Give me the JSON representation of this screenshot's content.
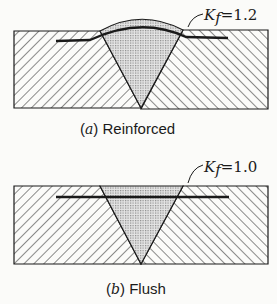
{
  "figures": [
    {
      "id": "a",
      "caption_letter": "a",
      "caption_text": "Reinforced",
      "label_k": "K",
      "label_sub": "f",
      "label_value": "=1.2"
    },
    {
      "id": "b",
      "caption_letter": "b",
      "caption_text": "Flush",
      "label_k": "K",
      "label_sub": "f",
      "label_value": "=1.0"
    }
  ],
  "colors": {
    "ink": "#1a1a1a",
    "background": "#fbfbf9",
    "weld_fill": "#cfcfcf"
  }
}
